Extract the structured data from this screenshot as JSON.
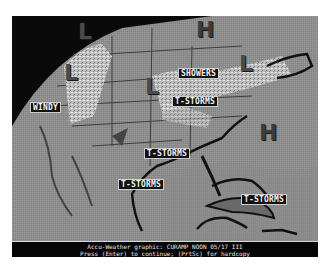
{
  "map": {
    "title": "Accu-Weather graphic",
    "pressure_centers": [
      {
        "type": "L",
        "label": "L",
        "x": 68,
        "y": 22
      },
      {
        "type": "L",
        "label": "L",
        "x": 52,
        "y": 56
      },
      {
        "type": "H",
        "label": "H",
        "x": 193,
        "y": 16
      },
      {
        "type": "L",
        "label": "L",
        "x": 137,
        "y": 60
      },
      {
        "type": "L",
        "label": "L",
        "x": 230,
        "y": 52
      },
      {
        "type": "H",
        "label": "H",
        "x": 246,
        "y": 104
      }
    ],
    "weather_labels": [
      {
        "text": "WINDY",
        "x": 18,
        "y": 86
      },
      {
        "text": "SHOWERS",
        "x": 166,
        "y": 52
      },
      {
        "text": "T-STORMS",
        "x": 160,
        "y": 80
      },
      {
        "text": "T-STORMS",
        "x": 132,
        "y": 132
      },
      {
        "text": "T-STORMS",
        "x": 106,
        "y": 163
      },
      {
        "text": "T-STORMS",
        "x": 229,
        "y": 178
      }
    ]
  },
  "footer": {
    "line1": "Accu-Weather graphic: CURAMP NOON 05/17 III",
    "line2": "Press (Enter) to continue; (PrtSc) for hardcopy"
  }
}
